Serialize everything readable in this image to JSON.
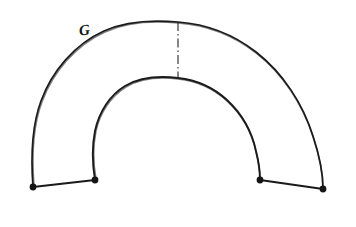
{
  "figure": {
    "kind": "hand-drawn-technical-sketch",
    "background_color": "#ffffff",
    "stroke_color": "#1a1a1a",
    "node_color": "#151515",
    "centerline_color": "#262626",
    "canvas": {
      "width": 356,
      "height": 227
    }
  },
  "labels": {
    "arc_label": "G",
    "arc_label_x": 79,
    "arc_label_y": 22,
    "arc_label_size": 15
  },
  "geometry": {
    "outer_arc": {
      "name": "outer-arc",
      "start_x": 33,
      "start_y": 187,
      "end_x": 323,
      "end_y": 189,
      "apex_x": 178,
      "apex_y": 22,
      "radius": 146
    },
    "inner_arc": {
      "name": "inner-arc",
      "start_x": 95,
      "start_y": 180,
      "end_x": 260,
      "end_y": 180,
      "apex_x": 178,
      "apex_y": 78,
      "radius": 84
    },
    "left_radial_edge": {
      "name": "left-radial-edge",
      "from_x": 33,
      "from_y": 187,
      "to_x": 95,
      "to_y": 180
    },
    "right_radial_edge": {
      "name": "right-radial-edge",
      "from_x": 260,
      "from_y": 180,
      "to_x": 323,
      "to_y": 189
    },
    "centerline": {
      "name": "vertical-centerline",
      "x": 178,
      "top_y": 22,
      "bottom_y": 79,
      "pattern": "dash-dot"
    },
    "nodes": [
      {
        "name": "node-outer-left",
        "x": 33,
        "y": 187,
        "r": 3.4
      },
      {
        "name": "node-inner-left",
        "x": 95,
        "y": 180,
        "r": 3.4
      },
      {
        "name": "node-inner-right",
        "x": 260,
        "y": 180,
        "r": 3.4
      },
      {
        "name": "node-outer-right",
        "x": 323,
        "y": 189,
        "r": 3.4
      }
    ]
  },
  "paths": {
    "outer_arc_d": "M 33 187 C 31 160 31 128 41 101 C 52 71 75 44 104 31 C 128 20 155 20 178 22 C 205 24 233 34 256 52 C 283 73 303 104 313 136 C 320 157 323 174 323 189",
    "inner_arc_d": "M 95 180 C 92 162 92 146 95 131 C 99 112 110 95 125 86 C 142 76 161 76 178 78 C 196 80 214 88 227 100 C 242 114 252 132 256 151 C 259 163 260 172 260 180",
    "outer_arc_shadow_d": "M 34 186 C 32 159 32 128 42 102 C 53 72 76 45 105 32 C 129 21 156 21 178 23 C 205 25 233 35 256 53 C 283 74 303 105 313 137 C 320 158 323 174 323 188",
    "inner_arc_shadow_d": "M 96 179 C 93 162 93 146 96 131 C 100 113 111 96 126 87 C 143 77 161 77 178 79 C 196 81 214 89 227 101 C 242 115 252 133 256 152 C 259 164 260 172 260 179",
    "left_edge_d": "M 33 187 L 95 180",
    "right_edge_d": "M 260 180 L 323 189"
  }
}
